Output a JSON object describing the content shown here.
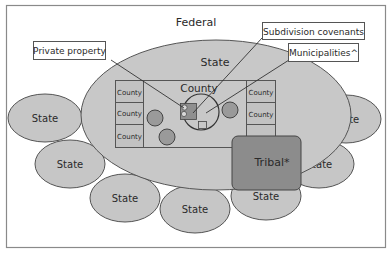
{
  "diagram": {
    "federal_label": "Federal",
    "state_main_label": "State",
    "county_main_label": "County",
    "left_counties": [
      "County",
      "County",
      "County"
    ],
    "right_counties": [
      "County",
      "County"
    ],
    "tribal_label": "Tribal*",
    "callouts": {
      "private_property": "Private property",
      "subdivision_covenants": "Subdivision covenants",
      "municipalities": "Municipalities^"
    },
    "surrounding_states": [
      "State",
      "State",
      "State",
      "State",
      "State",
      "State",
      "State"
    ],
    "colors": {
      "state_fill": "#c6c6c6",
      "tribal_fill": "#8c8c8c",
      "municipality_fill": "#9a9a9a",
      "subdivision_fill": "#8f8f8f",
      "stroke": "#4a4a4a",
      "frame": "#8a8a8a"
    }
  }
}
